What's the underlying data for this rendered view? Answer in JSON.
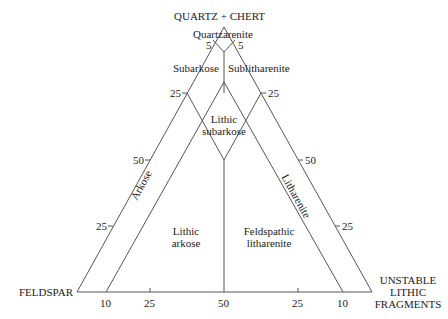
{
  "diagram": {
    "type": "ternary",
    "apices": {
      "top": "QUARTZ + CHERT",
      "left": "FELDSPAR",
      "right_line1": "UNSTABLE",
      "right_line2": "LITHIC",
      "right_line3": "FRAGMENTS"
    },
    "fields": {
      "quartzarenite": "Quartzarenite",
      "subarkose": "Subarkose",
      "sublitharenite": "Sublitharenite",
      "lithic_subarkose_1": "Lithic",
      "lithic_subarkose_2": "subarkose",
      "arkose": "Arkose",
      "litharenite": "Litharenite",
      "lithic_arkose_1": "Lithic",
      "lithic_arkose_2": "arkose",
      "feldspathic_litharenite_1": "Feldspathic",
      "feldspathic_litharenite_2": "litharenite"
    },
    "ticks": {
      "top_left_5": "5",
      "top_right_5": "5",
      "left_25_upper": "25",
      "left_50": "50",
      "left_25_lower": "25",
      "right_25_upper": "25",
      "right_50": "50",
      "right_25_lower": "25",
      "base_10_left": "10",
      "base_25_left": "25",
      "base_50": "50",
      "base_25_right": "25",
      "base_10_right": "10"
    },
    "stroke_color": "#555555"
  }
}
